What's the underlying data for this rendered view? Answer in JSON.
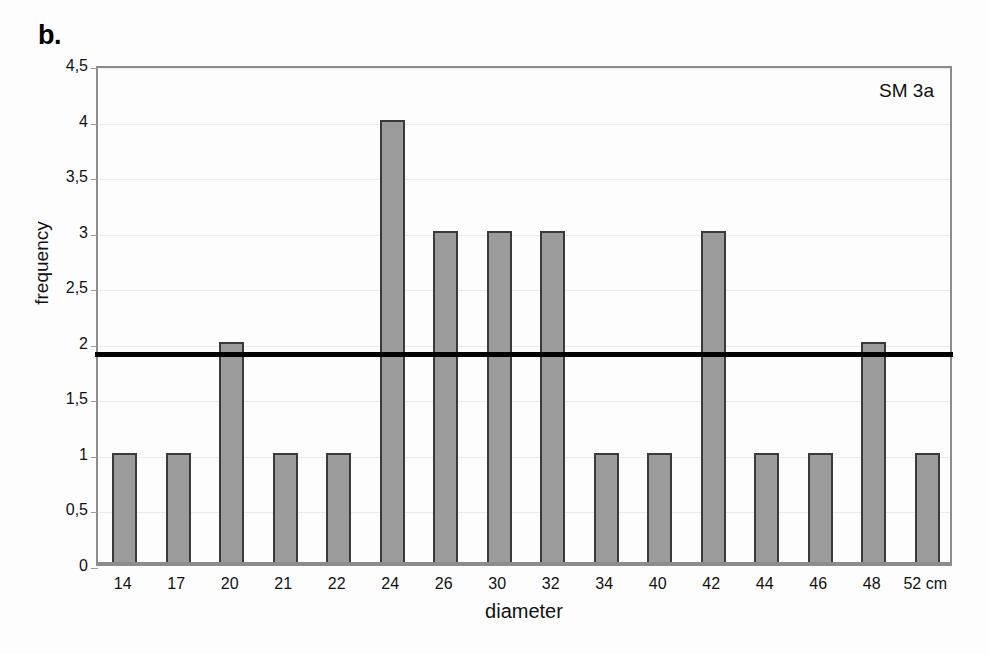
{
  "panel": {
    "letter": "b."
  },
  "annotation": {
    "text": "SM 3a"
  },
  "chart_data": {
    "type": "bar",
    "title": "",
    "subtitle": "",
    "xlabel": "diameter",
    "ylabel": "frequency",
    "categories": [
      "14",
      "17",
      "20",
      "21",
      "22",
      "24",
      "26",
      "30",
      "32",
      "34",
      "40",
      "42",
      "44",
      "46",
      "48",
      "52 cm"
    ],
    "values": [
      1,
      1,
      2,
      1,
      1,
      4,
      3,
      3,
      3,
      1,
      1,
      3,
      1,
      1,
      2,
      1
    ],
    "ylim": [
      0,
      4.5
    ],
    "ytick_values": [
      0,
      0.5,
      1,
      1.5,
      2,
      2.5,
      3,
      3.5,
      4,
      4.5
    ],
    "ytick_labels": [
      "0",
      "0,5",
      "1",
      "1,5",
      "2",
      "2,5",
      "3",
      "3,5",
      "4",
      "4,5"
    ],
    "grid": true,
    "legend": "none",
    "annotations": [
      {
        "name": "threshold-line",
        "type": "hline",
        "value": 1.93,
        "color": "#000000"
      },
      {
        "name": "series-label",
        "type": "text",
        "text": "SM 3a"
      }
    ],
    "colors": {
      "bar_fill": "#9b9b9b",
      "bar_stroke": "#3a3a3a",
      "axis": "#8c8c8c",
      "grid": "#eaeaea",
      "threshold": "#000000",
      "background": "#fdfdfd"
    }
  }
}
